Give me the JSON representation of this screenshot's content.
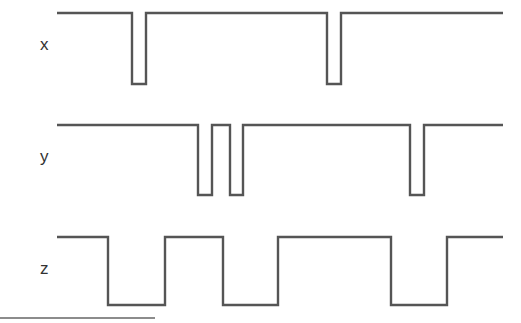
{
  "diagram": {
    "type": "timing-diagram",
    "stroke_color": "#555555",
    "label_color": "#333333",
    "background": "#ffffff",
    "signals": [
      {
        "name": "x",
        "label": "x",
        "label_pos": [
          40,
          50
        ],
        "high_y": 13,
        "low_y": 84,
        "start_x": 57,
        "end_x": 503,
        "initial": "high",
        "transitions_x": [
          132,
          146,
          327,
          341
        ]
      },
      {
        "name": "y",
        "label": "y",
        "label_pos": [
          40,
          162
        ],
        "high_y": 125,
        "low_y": 195,
        "start_x": 57,
        "end_x": 503,
        "initial": "high",
        "transitions_x": [
          198,
          212,
          230,
          243,
          410,
          424
        ]
      },
      {
        "name": "z",
        "label": "z",
        "label_pos": [
          40,
          274
        ],
        "high_y": 237,
        "low_y": 305,
        "start_x": 57,
        "end_x": 503,
        "initial": "high",
        "transitions_x": [
          108,
          165,
          223,
          278,
          391,
          447
        ]
      }
    ],
    "baseline": {
      "x1": 0,
      "x2": 155,
      "y": 318
    }
  }
}
